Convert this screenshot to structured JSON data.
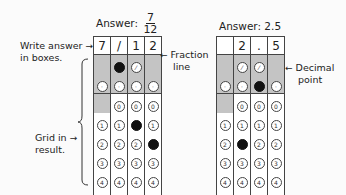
{
  "left_example": {
    "title_prefix": "Answer:",
    "fraction_numerator": "7",
    "fraction_denominator": "12",
    "boxes": [
      "7",
      "/",
      "1",
      "2"
    ],
    "slash_row": [
      "none",
      "filled",
      "empty",
      "none"
    ],
    "decimal_row": [
      "empty",
      "empty",
      "empty",
      "empty"
    ],
    "digit_columns_have_zero": [
      false,
      true,
      true,
      true
    ],
    "filled_digits": [
      7,
      null,
      1,
      2
    ]
  },
  "right_example": {
    "title": "Answer: 2.5",
    "boxes": [
      "",
      "2",
      ".",
      "5"
    ],
    "slash_row": [
      "none",
      "empty",
      "empty",
      "none"
    ],
    "decimal_row": [
      "empty",
      "empty",
      "filled",
      "empty"
    ],
    "digit_columns_have_zero": [
      false,
      true,
      true,
      true
    ],
    "filled_digits": [
      null,
      2,
      null,
      5
    ]
  },
  "annotations": {
    "write_answer": [
      "Write answer",
      "in boxes."
    ],
    "grid_in": [
      "Grid in",
      "result."
    ],
    "fraction_line": [
      "Fraction",
      "line"
    ],
    "decimal_point": [
      "Decimal",
      "point"
    ]
  },
  "symbols": {
    "slash": "⁄",
    "decimal": "·",
    "arrow_right": "→",
    "arrow_left": "←"
  },
  "digits": [
    "0",
    "1",
    "2",
    "3",
    "4",
    "5",
    "6",
    "7",
    "8",
    "9"
  ]
}
